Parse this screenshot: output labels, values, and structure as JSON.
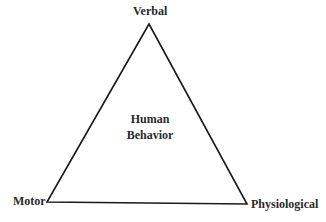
{
  "diagram": {
    "type": "triangle",
    "vertices": {
      "top": {
        "label": "Verbal"
      },
      "bottom_left": {
        "label": "Motor"
      },
      "bottom_right": {
        "label": "Physiological"
      }
    },
    "center": {
      "line1": "Human",
      "line2": "Behavior"
    },
    "colors": {
      "stroke": "#1a1a1a",
      "text": "#2a2a2a",
      "background": "#ffffff"
    }
  }
}
